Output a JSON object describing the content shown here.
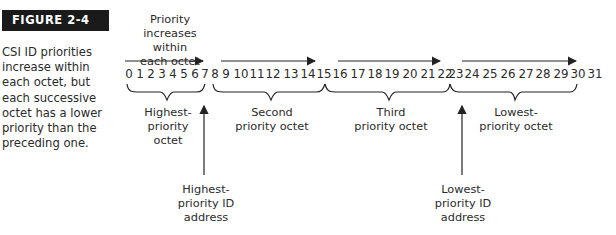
{
  "figure": {
    "label": "FIGURE 2-4",
    "caption": "CSI ID priorities increase within each octet, but each successive octet has a lower priority than the preceding one."
  },
  "diagram": {
    "top_label": [
      "Priority",
      "increases within",
      "each octet"
    ],
    "ids": [
      "0",
      "1",
      "2",
      "3",
      "4",
      "5",
      "6",
      "7",
      "8",
      "9",
      "10",
      "11",
      "12",
      "13",
      "14",
      "15",
      "16",
      "17",
      "18",
      "19",
      "20",
      "21",
      "22",
      "23",
      "24",
      "25",
      "26",
      "27",
      "28",
      "29",
      "30",
      "31"
    ],
    "octets": [
      {
        "line1": "Highest-",
        "line2": "priority octet"
      },
      {
        "line1": "Second",
        "line2": "priority octet"
      },
      {
        "line1": "Third",
        "line2": "priority octet"
      },
      {
        "line1": "Lowest-",
        "line2": "priority octet"
      }
    ],
    "pointers": [
      {
        "lines": [
          "Highest-",
          "priority ID",
          "address"
        ]
      },
      {
        "lines": [
          "Lowest-",
          "priority ID",
          "address"
        ]
      }
    ]
  }
}
